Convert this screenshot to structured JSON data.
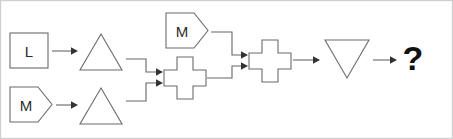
{
  "canvas": {
    "width": 453,
    "height": 139,
    "background_color": "#ffffff",
    "border_color": "#d0d0d0"
  },
  "style": {
    "shape_stroke_color": "#6b6b6b",
    "connector_color": "#666666",
    "arrow_fill_color": "#333333",
    "label_color": "#2b2b2b",
    "question_color": "#111111"
  },
  "diagram": {
    "type": "flowchart",
    "title": "",
    "nodes": [
      {
        "id": "n1",
        "shape": "square",
        "label": "L",
        "x": 10,
        "y": 33,
        "width": 38,
        "height": 35
      },
      {
        "id": "n2",
        "shape": "pentagon-right",
        "label": "M",
        "x": 10,
        "y": 87,
        "width": 42,
        "height": 35
      },
      {
        "id": "n3",
        "shape": "triangle-up",
        "label": "",
        "x": 80,
        "y": 34,
        "width": 42,
        "height": 36
      },
      {
        "id": "n4",
        "shape": "triangle-up",
        "label": "",
        "x": 80,
        "y": 88,
        "width": 42,
        "height": 36
      },
      {
        "id": "n5",
        "shape": "pentagon-right",
        "label": "M",
        "x": 166,
        "y": 13,
        "width": 42,
        "height": 35
      },
      {
        "id": "n6",
        "shape": "cross",
        "label": "",
        "x": 164,
        "y": 57,
        "width": 42,
        "height": 42
      },
      {
        "id": "n7",
        "shape": "cross",
        "label": "",
        "x": 249,
        "y": 40,
        "width": 42,
        "height": 42
      },
      {
        "id": "n8",
        "shape": "triangle-down",
        "label": "",
        "x": 325,
        "y": 40,
        "width": 44,
        "height": 38
      },
      {
        "id": "n9",
        "shape": "text",
        "label": "?",
        "x": 400,
        "y": 40,
        "width": 26,
        "height": 38
      }
    ],
    "edges": [
      {
        "id": "e1",
        "from": "n1",
        "to": "n3",
        "routing": "straight"
      },
      {
        "id": "e2",
        "from": "n2",
        "to": "n4",
        "routing": "straight"
      },
      {
        "id": "e3",
        "from": "n3",
        "to": "n6",
        "routing": "elbow-down"
      },
      {
        "id": "e4",
        "from": "n4",
        "to": "n6",
        "routing": "elbow-up"
      },
      {
        "id": "e5",
        "from": "n5",
        "to": "n7",
        "routing": "elbow-down"
      },
      {
        "id": "e6",
        "from": "n6",
        "to": "n7",
        "routing": "elbow-up"
      },
      {
        "id": "e7",
        "from": "n7",
        "to": "n8",
        "routing": "straight"
      },
      {
        "id": "e8",
        "from": "n8",
        "to": "n9",
        "routing": "straight"
      }
    ]
  }
}
